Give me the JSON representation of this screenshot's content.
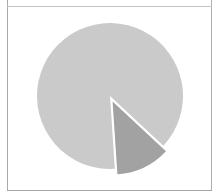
{
  "chart_data": {
    "type": "pie",
    "title": "",
    "labels": [
      "Major slice",
      "Exploded slice"
    ],
    "values": [
      88,
      12
    ],
    "colors": [
      "#cacaca",
      "#a2a2a2"
    ],
    "exploded": [
      false,
      true
    ],
    "start_angle_deg": 133,
    "direction": "clockwise",
    "legend": "none",
    "data_labels": "none"
  },
  "layout": {
    "center": [
      110,
      96
    ],
    "radius": 73,
    "explode_offset": 6,
    "frame_color": "#a9a9a9"
  }
}
